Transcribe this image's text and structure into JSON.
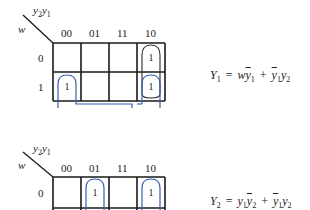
{
  "maps": [
    {
      "corner_row_var": "w",
      "corner_col_vars": {
        "a": "y",
        "a_sub": "2",
        "b": "y",
        "b_sub": "1"
      },
      "col_labels": [
        "00",
        "01",
        "11",
        "10"
      ],
      "row_labels": [
        "0",
        "1"
      ],
      "cells": [
        [
          "",
          "",
          "",
          "1"
        ],
        [
          "1",
          "",
          "",
          "1"
        ]
      ],
      "equation": {
        "lhs": "Y",
        "lhs_sub": "1",
        "eq": "=",
        "t1a": "w",
        "t1b": "y",
        "t1b_sub": "1",
        "plus": "+",
        "t2a": "y",
        "t2a_sub": "1",
        "t2b": "y",
        "t2b_sub": "2"
      }
    },
    {
      "corner_row_var": "w",
      "corner_col_vars": {
        "a": "y",
        "a_sub": "2",
        "b": "y",
        "b_sub": "1"
      },
      "col_labels": [
        "00",
        "01",
        "11",
        "10"
      ],
      "row_labels": [
        "0"
      ],
      "cells": [
        [
          "",
          "1",
          "",
          "1"
        ]
      ],
      "equation": {
        "lhs": "Y",
        "lhs_sub": "2",
        "eq": "=",
        "t1a": "y",
        "t1a_sub": "1",
        "t1b": "y",
        "t1b_sub": "2",
        "plus": "+",
        "t2a": "y",
        "t2a_sub": "1",
        "t2b": "y",
        "t2b_sub": "2"
      }
    }
  ],
  "colors": {
    "grid": "#1a1a1a",
    "loop_black": "#2a2a2a",
    "loop_blue": "#3a5fb0"
  }
}
